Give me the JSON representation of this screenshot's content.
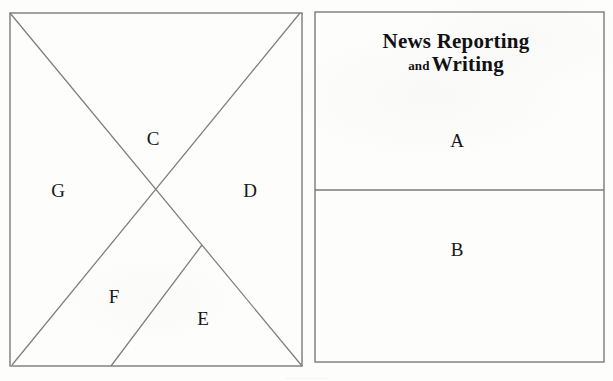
{
  "page": {
    "background_color": "#fdfdfc",
    "ink_color": "#6a6a6a",
    "text_color": "#17171a",
    "width": 613,
    "height": 381
  },
  "left_figure": {
    "name": "divided-rectangle-diagram",
    "frame": {
      "x": 10,
      "y": 13,
      "width": 292,
      "height": 353
    },
    "lines": [
      {
        "name": "diagonal-top-left-to-bottom-right",
        "x1": 10,
        "y1": 13,
        "x2": 302,
        "y2": 366
      },
      {
        "name": "diagonal-top-right-to-bottom-left",
        "x1": 300,
        "y1": 13,
        "x2": 12,
        "y2": 365
      },
      {
        "name": "branch-line-bottom-to-right-diagonal",
        "x1": 111,
        "y1": 366,
        "x2": 202,
        "y2": 245
      }
    ],
    "region_labels": [
      {
        "id": "C",
        "text": "C",
        "x": 153,
        "y": 138
      },
      {
        "id": "G",
        "text": "G",
        "x": 58,
        "y": 190
      },
      {
        "id": "D",
        "text": "D",
        "x": 250,
        "y": 190
      },
      {
        "id": "F",
        "text": "F",
        "x": 114,
        "y": 296
      },
      {
        "id": "E",
        "text": "E",
        "x": 203,
        "y": 318
      }
    ]
  },
  "right_figure": {
    "name": "book-cover-layout-diagram",
    "frame": {
      "x": 315,
      "y": 12,
      "width": 289,
      "height": 350
    },
    "divider": {
      "name": "horizontal-divider",
      "x1": 315,
      "y1": 190,
      "x2": 604,
      "y2": 190
    },
    "title": {
      "line1": "News Reporting",
      "small_word": "and",
      "line2": "Writing",
      "x": 456,
      "y": 30
    },
    "region_labels": [
      {
        "id": "A",
        "text": "A",
        "x": 457,
        "y": 140
      },
      {
        "id": "B",
        "text": "B",
        "x": 457,
        "y": 249
      }
    ]
  },
  "bleed_through": {
    "text": "..............."
  }
}
